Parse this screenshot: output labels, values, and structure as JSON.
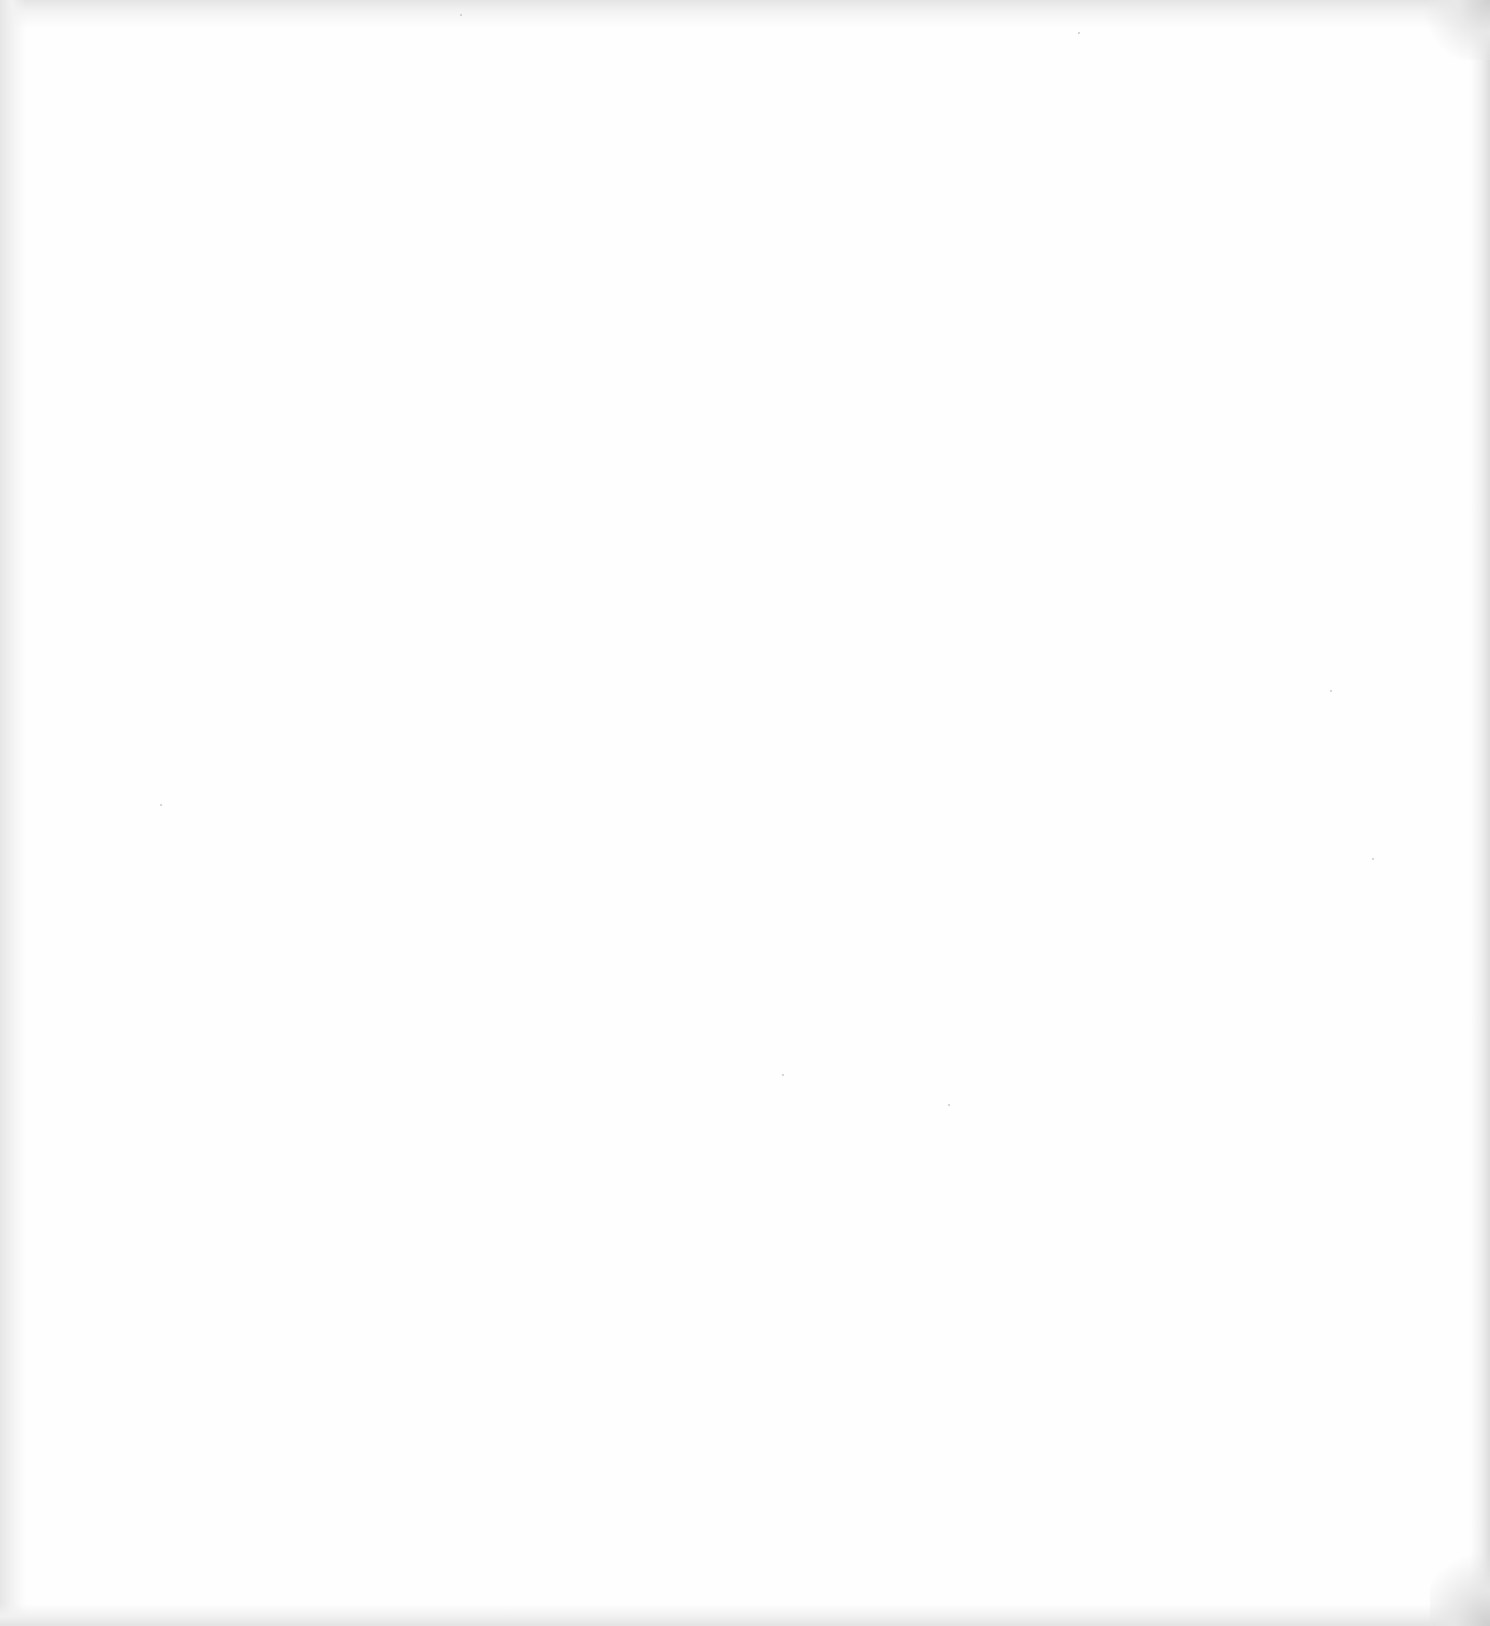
{
  "document": {
    "type": "blank scanned page",
    "text_content": "",
    "background_color": "#fefefe",
    "edge_shadow_color": "#e4e4e4"
  }
}
